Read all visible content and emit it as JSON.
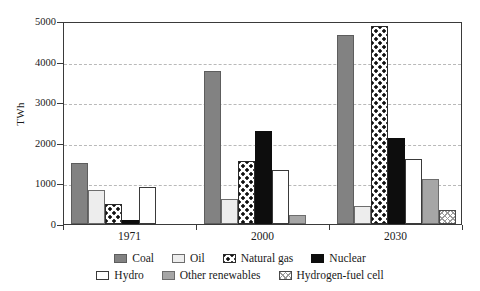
{
  "chart_data": {
    "type": "bar",
    "title": "",
    "xlabel": "",
    "ylabel": "TWh",
    "ylim": [
      0,
      5000
    ],
    "yticks": [
      0,
      1000,
      2000,
      3000,
      4000,
      5000
    ],
    "ytick_labels": [
      "0",
      "1000",
      "2000",
      "3000",
      "4000",
      "5000"
    ],
    "grid": "horizontal-dashed",
    "legend_position": "bottom",
    "categories": [
      "1971",
      "2000",
      "2030"
    ],
    "series": [
      {
        "name": "Coal",
        "values": [
          1500,
          3780,
          4650
        ],
        "color": "#828282",
        "pattern": "solid-gray"
      },
      {
        "name": "Oil",
        "values": [
          850,
          620,
          450
        ],
        "color": "#ededed",
        "pattern": "solid-light"
      },
      {
        "name": "Natural gas",
        "values": [
          500,
          1560,
          4880
        ],
        "color": "#ffffff",
        "pattern": "polka-dot"
      },
      {
        "name": "Nuclear",
        "values": [
          100,
          2280,
          2120
        ],
        "color": "#0d0d0d",
        "pattern": "solid-black"
      },
      {
        "name": "Hydro",
        "values": [
          900,
          1330,
          1600
        ],
        "color": "#ffffff",
        "pattern": "outline"
      },
      {
        "name": "Other renewables",
        "values": [
          0,
          220,
          1120
        ],
        "color": "#a6a6a6",
        "pattern": "solid-midgray"
      },
      {
        "name": "Hydrogen-fuel cell",
        "values": [
          0,
          0,
          350
        ],
        "color": "#ffffff",
        "pattern": "cross-hatch"
      }
    ]
  },
  "axis": {
    "y_label": "TWh",
    "y_ticks": [
      "5000",
      "4000",
      "3000",
      "2000",
      "1000",
      "0"
    ],
    "x_ticks": [
      "1971",
      "2000",
      "2030"
    ]
  },
  "legend": {
    "row1": [
      {
        "label": "Coal",
        "swatch": "sw-coal"
      },
      {
        "label": "Oil",
        "swatch": "sw-oil"
      },
      {
        "label": "Natural gas",
        "swatch": "sw-gas"
      },
      {
        "label": "Nuclear",
        "swatch": "sw-nuc"
      }
    ],
    "row2": [
      {
        "label": "Hydro",
        "swatch": "sw-hyd"
      },
      {
        "label": "Other renewables",
        "swatch": "sw-oren"
      },
      {
        "label": "Hydrogen-fuel cell",
        "swatch": "sw-h2"
      }
    ]
  }
}
